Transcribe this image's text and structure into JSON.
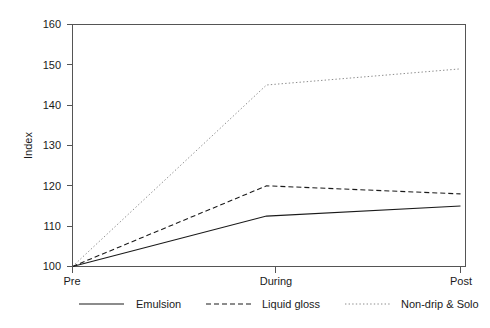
{
  "chart_data": {
    "type": "line",
    "title": "",
    "subtitle": "",
    "xlabel": "",
    "ylabel": "Index",
    "categories": [
      "Pre",
      "During",
      "Post"
    ],
    "ylim": [
      100,
      160
    ],
    "yticks": [
      100,
      110,
      120,
      130,
      140,
      150,
      160
    ],
    "ytick_labels": [
      "100",
      "110",
      "120",
      "130",
      "140",
      "150",
      "160"
    ],
    "grid": false,
    "legend_position": "bottom",
    "series": [
      {
        "name": "Emulsion",
        "values": [
          100,
          112.5,
          115
        ],
        "style": "solid",
        "color": "#1a1a1a"
      },
      {
        "name": "Liquid gloss",
        "values": [
          100,
          120,
          118
        ],
        "style": "dashed",
        "color": "#1a1a1a"
      },
      {
        "name": "Non-drip & Solo",
        "values": [
          100,
          145,
          149
        ],
        "style": "dotted",
        "color": "#8c8c8c"
      }
    ]
  },
  "axis": {
    "y_title": "Index",
    "y_tick_0": "100",
    "y_tick_1": "110",
    "y_tick_2": "120",
    "y_tick_3": "130",
    "y_tick_4": "140",
    "y_tick_5": "150",
    "y_tick_6": "160",
    "x_tick_0": "Pre",
    "x_tick_1": "During",
    "x_tick_2": "Post"
  },
  "legend": {
    "items": [
      {
        "label": "Emulsion",
        "style": "solid",
        "color": "#1a1a1a"
      },
      {
        "label": "Liquid gloss",
        "style": "dashed",
        "color": "#1a1a1a"
      },
      {
        "label": "Non-drip & Solo",
        "style": "dotted",
        "color": "#8c8c8c"
      }
    ]
  }
}
